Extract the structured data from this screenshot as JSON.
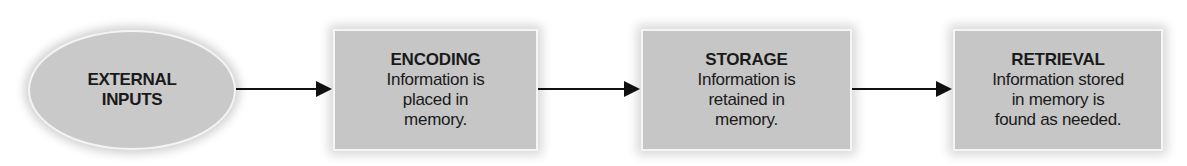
{
  "diagram": {
    "type": "flowchart",
    "input": {
      "label": "EXTERNAL INPUTS",
      "lines": [
        "EXTERNAL",
        "INPUTS"
      ]
    },
    "stages": [
      {
        "title": "ENCODING",
        "lines": [
          "Information is",
          "placed in",
          "memory."
        ]
      },
      {
        "title": "STORAGE",
        "lines": [
          "Information is",
          "retained in",
          "memory."
        ]
      },
      {
        "title": "RETRIEVAL",
        "lines": [
          "Information stored",
          "in memory is",
          "found as needed."
        ]
      }
    ],
    "connectors": [
      {
        "from": "EXTERNAL INPUTS",
        "to": "ENCODING"
      },
      {
        "from": "ENCODING",
        "to": "STORAGE"
      },
      {
        "from": "STORAGE",
        "to": "RETRIEVAL"
      }
    ],
    "colors": {
      "node_fill": "#c6c6c6",
      "node_border": "#f5f5f5",
      "arrow": "#111111",
      "text": "#1a1a1a"
    }
  }
}
